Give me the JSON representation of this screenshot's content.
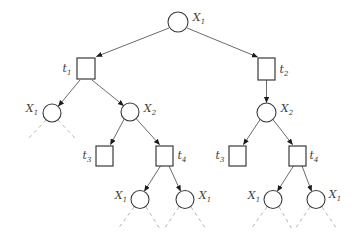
{
  "diagram": {
    "type": "decision-tree",
    "background_color": "#ffffff",
    "edge_color": "#5a5a5a",
    "dashed_edge_color": "#b5b5b5",
    "node_outline_color": "#3a3a3a",
    "node_shapes": {
      "circle": "variable-node",
      "square": "test-node"
    },
    "nodes": {
      "root": {
        "shape": "circle",
        "base": "X",
        "sub": "1",
        "label_side": "right"
      },
      "t1": {
        "shape": "square",
        "base": "t",
        "sub": "1",
        "label_side": "left"
      },
      "t2": {
        "shape": "square",
        "base": "t",
        "sub": "2",
        "label_side": "right"
      },
      "x1a": {
        "shape": "circle",
        "base": "X",
        "sub": "1",
        "label_side": "left"
      },
      "x2a": {
        "shape": "circle",
        "base": "X",
        "sub": "2",
        "label_side": "right"
      },
      "x2b": {
        "shape": "circle",
        "base": "X",
        "sub": "2",
        "label_side": "right"
      },
      "t3a": {
        "shape": "square",
        "base": "t",
        "sub": "3",
        "label_side": "left"
      },
      "t4a": {
        "shape": "square",
        "base": "t",
        "sub": "4",
        "label_side": "right"
      },
      "t3b": {
        "shape": "square",
        "base": "t",
        "sub": "3",
        "label_side": "left"
      },
      "t4b": {
        "shape": "square",
        "base": "t",
        "sub": "4",
        "label_side": "right"
      },
      "x1b": {
        "shape": "circle",
        "base": "X",
        "sub": "1",
        "label_side": "left"
      },
      "x1c": {
        "shape": "circle",
        "base": "X",
        "sub": "1",
        "label_side": "right"
      },
      "x1d": {
        "shape": "circle",
        "base": "X",
        "sub": "1",
        "label_side": "left"
      },
      "x1e": {
        "shape": "circle",
        "base": "X",
        "sub": "1",
        "label_side": "right"
      }
    },
    "edges": [
      {
        "from": "root",
        "to": "t1",
        "style": "solid-arrow"
      },
      {
        "from": "root",
        "to": "t2",
        "style": "solid-arrow"
      },
      {
        "from": "t1",
        "to": "x1a",
        "style": "solid-arrow"
      },
      {
        "from": "t1",
        "to": "x2a",
        "style": "solid-arrow"
      },
      {
        "from": "t2",
        "to": "x2b",
        "style": "solid-arrow"
      },
      {
        "from": "x2a",
        "to": "t3a",
        "style": "solid-arrow"
      },
      {
        "from": "x2a",
        "to": "t4a",
        "style": "solid-arrow"
      },
      {
        "from": "x2b",
        "to": "t3b",
        "style": "solid-arrow"
      },
      {
        "from": "x2b",
        "to": "t4b",
        "style": "solid-arrow"
      },
      {
        "from": "t4a",
        "to": "x1b",
        "style": "solid-arrow"
      },
      {
        "from": "t4a",
        "to": "x1c",
        "style": "solid-arrow"
      },
      {
        "from": "t4b",
        "to": "x1d",
        "style": "solid-arrow"
      },
      {
        "from": "t4b",
        "to": "x1e",
        "style": "solid-arrow"
      },
      {
        "from": "x1a",
        "to": "unexpanded-left",
        "style": "dashed"
      },
      {
        "from": "x1a",
        "to": "unexpanded-right",
        "style": "dashed"
      },
      {
        "from": "x1b",
        "to": "unexpanded-left",
        "style": "dashed"
      },
      {
        "from": "x1b",
        "to": "unexpanded-right",
        "style": "dashed"
      },
      {
        "from": "x1c",
        "to": "unexpanded-left",
        "style": "dashed"
      },
      {
        "from": "x1c",
        "to": "unexpanded-right",
        "style": "dashed"
      },
      {
        "from": "x1d",
        "to": "unexpanded-left",
        "style": "dashed"
      },
      {
        "from": "x1d",
        "to": "unexpanded-right",
        "style": "dashed"
      },
      {
        "from": "x1e",
        "to": "unexpanded-left",
        "style": "dashed"
      },
      {
        "from": "x1e",
        "to": "unexpanded-right",
        "style": "dashed"
      }
    ]
  }
}
